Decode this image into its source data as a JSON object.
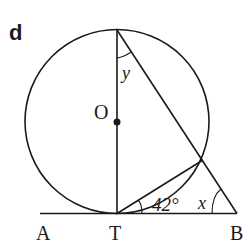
{
  "diagram": {
    "part_label": "d",
    "points": {
      "A": "A",
      "T": "T",
      "B": "B",
      "O": "O"
    },
    "angles": {
      "y_label": "y",
      "x_label": "x",
      "given_angle": "42°"
    },
    "colors": {
      "line": "#1a1a1a",
      "background": "#ffffff"
    }
  }
}
